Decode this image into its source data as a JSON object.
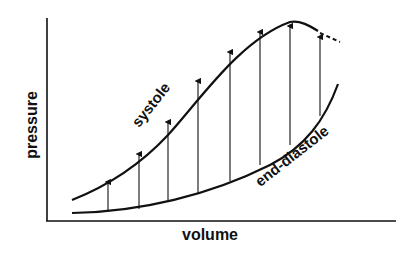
{
  "diagram": {
    "axes": {
      "x_label": "volume",
      "y_label": "pressure"
    },
    "curves": [
      {
        "name": "systole",
        "label": "systole",
        "style": "solid",
        "continuation": "dashed"
      },
      {
        "name": "end-diastole",
        "label": "end-diastole",
        "style": "solid"
      }
    ],
    "arrows": {
      "count": 8,
      "direction": "up",
      "from": "end-diastole",
      "to": "systole"
    },
    "colors": {
      "ink": "#111111",
      "background": "#ffffff"
    }
  }
}
